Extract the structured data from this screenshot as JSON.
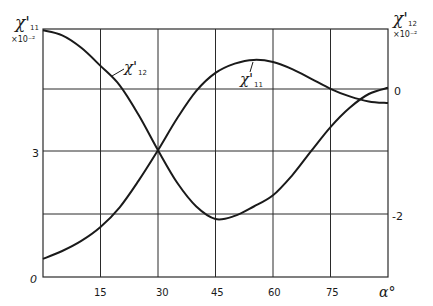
{
  "chart_data": {
    "type": "line",
    "title": "",
    "xlabel": "α°",
    "ylabel_left": "χ'11 ×10⁻²",
    "ylabel_right": "χ'12 ×10⁻²",
    "xlim": [
      0,
      90
    ],
    "ylim_left": [
      0,
      5.9
    ],
    "ylim_right": [
      -3.0,
      0.95
    ],
    "x_ticks": [
      15,
      30,
      45,
      60,
      75
    ],
    "y_ticks_left": [
      {
        "value": 0,
        "label": "0"
      },
      {
        "value": 3,
        "label": "3"
      }
    ],
    "y_ticks_right": [
      {
        "value": 0,
        "label": "0"
      },
      {
        "value": -2,
        "label": "-2"
      }
    ],
    "grid": true,
    "series": [
      {
        "name": "χ'11",
        "axis": "left",
        "label": {
          "main": "χ'",
          "sub": "11"
        },
        "x": [
          0,
          5,
          10,
          15,
          20,
          25,
          30,
          35,
          40,
          45,
          50,
          55,
          60,
          65,
          70,
          75,
          80,
          85,
          90
        ],
        "values": [
          0.43,
          0.62,
          0.86,
          1.19,
          1.66,
          2.3,
          3.02,
          3.78,
          4.43,
          4.86,
          5.08,
          5.17,
          5.12,
          4.95,
          4.72,
          4.48,
          4.3,
          4.18,
          4.14
        ]
      },
      {
        "name": "χ'12",
        "axis": "right",
        "label": {
          "main": "χ'",
          "sub": "12"
        },
        "x": [
          0,
          5,
          10,
          15,
          20,
          25,
          30,
          35,
          40,
          45,
          50,
          55,
          60,
          65,
          70,
          75,
          80,
          85,
          90
        ],
        "values": [
          0.94,
          0.86,
          0.66,
          0.37,
          0.06,
          -0.42,
          -0.98,
          -1.5,
          -1.88,
          -2.08,
          -2.03,
          -1.88,
          -1.7,
          -1.38,
          -0.99,
          -0.61,
          -0.3,
          -0.08,
          0.02
        ]
      }
    ]
  },
  "axes": {
    "left_title": "χ'",
    "left_title_sub": "11",
    "left_scale": "×10⁻²",
    "right_title": "χ'",
    "right_title_sub": "12",
    "right_scale": "×10⁻²",
    "x_title": "α°",
    "x_tick_labels": [
      "15",
      "30",
      "45",
      "60",
      "75"
    ],
    "left_tick_labels": [
      "0",
      "3"
    ],
    "right_tick_labels": [
      "0",
      "-2"
    ]
  },
  "annotations": {
    "curve_11_label": "χ'",
    "curve_11_sub": "11",
    "curve_12_label": "χ'",
    "curve_12_sub": "12"
  }
}
